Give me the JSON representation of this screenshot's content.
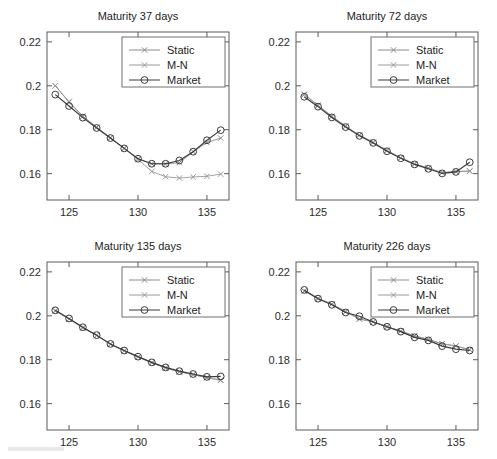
{
  "figure": {
    "background": "#ffffff",
    "panel_count": 4
  },
  "axes": {
    "xlabel": "",
    "ylabel": "",
    "xlim": [
      123.4,
      136.6
    ],
    "ylim": [
      0.148,
      0.2245
    ],
    "xticks": [
      125,
      130,
      135
    ],
    "xtick_labels": [
      "125",
      "130",
      "135"
    ],
    "yticks": [
      0.16,
      0.18,
      0.2,
      0.22
    ],
    "ytick_labels": [
      "0.16",
      "0.18",
      "0.2",
      "0.22"
    ],
    "grid": false
  },
  "legend": {
    "position": "top-right",
    "entries": [
      {
        "label": "Static",
        "marker": "x",
        "color": "#8c8c8c"
      },
      {
        "label": "M-N",
        "marker": "x",
        "color": "#9a9a9a"
      },
      {
        "label": "Market",
        "marker": "o",
        "color": "#3a3a3a"
      }
    ]
  },
  "colors": {
    "static": "#8c8c8c",
    "mn": "#9a9a9a",
    "market": "#3a3a3a",
    "axis": "#5a5a5a",
    "text": "#1d1d1d"
  },
  "chart_data": [
    {
      "type": "line",
      "title": "Maturity 37 days",
      "xlabel": "",
      "ylabel": "",
      "xlim": [
        123.4,
        136.6
      ],
      "ylim": [
        0.148,
        0.2245
      ],
      "x": [
        124,
        125,
        126,
        127,
        128,
        129,
        130,
        131,
        132,
        133,
        134,
        135,
        136
      ],
      "series": [
        {
          "name": "Static",
          "marker": "x",
          "values": [
            0.2,
            0.1925,
            0.186,
            0.181,
            0.1762,
            0.1715,
            0.1668,
            0.1645,
            0.1644,
            0.165,
            0.17,
            0.1742,
            0.1762
          ]
        },
        {
          "name": "M-N",
          "marker": "x",
          "values": [
            0.2,
            0.1928,
            0.1862,
            0.1812,
            0.1763,
            0.1716,
            0.1664,
            0.161,
            0.1586,
            0.158,
            0.1585,
            0.1588,
            0.1598
          ]
        },
        {
          "name": "Market",
          "marker": "o",
          "values": [
            0.196,
            0.1908,
            0.1855,
            0.1808,
            0.1762,
            0.1715,
            0.1668,
            0.1645,
            0.1645,
            0.166,
            0.17,
            0.1752,
            0.1798
          ]
        }
      ]
    },
    {
      "type": "line",
      "title": "Maturity 72 days",
      "xlabel": "",
      "ylabel": "",
      "xlim": [
        123.4,
        136.6
      ],
      "ylim": [
        0.148,
        0.2245
      ],
      "x": [
        124,
        125,
        126,
        127,
        128,
        129,
        130,
        131,
        132,
        133,
        134,
        135,
        136
      ],
      "series": [
        {
          "name": "Static",
          "marker": "x",
          "values": [
            0.196,
            0.191,
            0.186,
            0.1815,
            0.1775,
            0.1742,
            0.1705,
            0.1672,
            0.1645,
            0.1625,
            0.1605,
            0.161,
            0.1612
          ]
        },
        {
          "name": "M-N",
          "marker": "x",
          "values": [
            0.1962,
            0.1912,
            0.1862,
            0.1816,
            0.1776,
            0.1743,
            0.1706,
            0.1672,
            0.1644,
            0.1624,
            0.1604,
            0.1609,
            0.1611
          ]
        },
        {
          "name": "Market",
          "marker": "o",
          "values": [
            0.195,
            0.1905,
            0.1856,
            0.1812,
            0.1772,
            0.174,
            0.1702,
            0.167,
            0.1642,
            0.1622,
            0.1601,
            0.1608,
            0.1652
          ]
        }
      ]
    },
    {
      "type": "line",
      "title": "Maturity 135 days",
      "xlabel": "",
      "ylabel": "",
      "xlim": [
        123.4,
        136.6
      ],
      "ylim": [
        0.148,
        0.2245
      ],
      "x": [
        124,
        125,
        126,
        127,
        128,
        129,
        130,
        131,
        132,
        133,
        134,
        135,
        136
      ],
      "series": [
        {
          "name": "Static",
          "marker": "x",
          "values": [
            0.2022,
            0.1985,
            0.1945,
            0.191,
            0.187,
            0.184,
            0.1812,
            0.1786,
            0.1762,
            0.1745,
            0.1732,
            0.1718,
            0.1706
          ]
        },
        {
          "name": "M-N",
          "marker": "x",
          "values": [
            0.2024,
            0.1986,
            0.1946,
            0.1911,
            0.1871,
            0.1841,
            0.1813,
            0.1787,
            0.1763,
            0.1746,
            0.1733,
            0.1719,
            0.1708
          ]
        },
        {
          "name": "Market",
          "marker": "o",
          "values": [
            0.2025,
            0.1988,
            0.1948,
            0.1912,
            0.1872,
            0.1842,
            0.1814,
            0.1788,
            0.1765,
            0.1748,
            0.1735,
            0.1722,
            0.1724
          ]
        }
      ]
    },
    {
      "type": "line",
      "title": "Maturity 226 days",
      "xlabel": "",
      "ylabel": "",
      "xlim": [
        123.4,
        136.6
      ],
      "ylim": [
        0.148,
        0.2245
      ],
      "x": [
        124,
        125,
        126,
        127,
        128,
        129,
        130,
        131,
        132,
        133,
        134,
        135,
        136
      ],
      "series": [
        {
          "name": "Static",
          "marker": "x",
          "values": [
            0.2112,
            0.2078,
            0.2052,
            0.2018,
            0.1985,
            0.1972,
            0.195,
            0.193,
            0.1908,
            0.1892,
            0.1872,
            0.1862,
            0.1845
          ]
        },
        {
          "name": "M-N",
          "marker": "x",
          "values": [
            0.2114,
            0.208,
            0.2054,
            0.202,
            0.1986,
            0.1973,
            0.1951,
            0.1931,
            0.1909,
            0.1893,
            0.1873,
            0.1863,
            0.1846
          ]
        },
        {
          "name": "Market",
          "marker": "o",
          "values": [
            0.2118,
            0.2078,
            0.205,
            0.2015,
            0.1998,
            0.1972,
            0.195,
            0.1928,
            0.1902,
            0.1888,
            0.1862,
            0.1848,
            0.1842
          ]
        }
      ]
    }
  ]
}
